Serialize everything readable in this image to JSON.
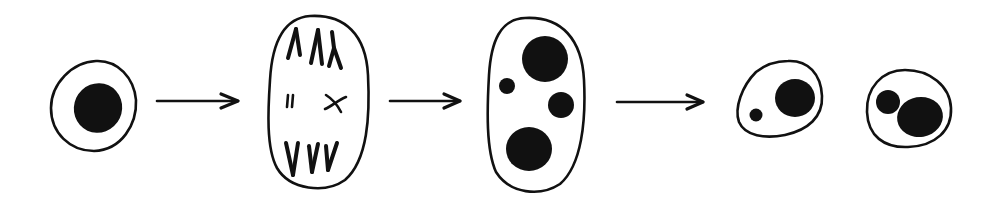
{
  "diagram": {
    "type": "cell-division-sequence",
    "colors": {
      "ink": "#111111",
      "background": "#ffffff"
    },
    "stages": [
      {
        "id": "stage-1",
        "description": "Single cell with one large dark nucleus",
        "nuclei_count": 1
      },
      {
        "id": "stage-2",
        "description": "Elongated cell with chromosomes separating toward poles",
        "nuclei_count": 0
      },
      {
        "id": "stage-3",
        "description": "Elongated cell with four dark nuclei of varying sizes",
        "nuclei_count": 4
      },
      {
        "id": "stage-4a",
        "description": "Daughter cell with one large and one small nucleus",
        "nuclei_count": 2
      },
      {
        "id": "stage-4b",
        "description": "Daughter cell with one medium and one large nucleus",
        "nuclei_count": 2
      }
    ],
    "arrows": [
      {
        "from": "stage-1",
        "to": "stage-2"
      },
      {
        "from": "stage-2",
        "to": "stage-3"
      },
      {
        "from": "stage-3",
        "to": "stage-4"
      }
    ]
  }
}
